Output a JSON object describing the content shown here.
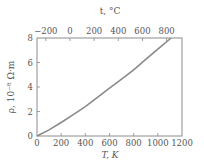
{
  "chart_data": {
    "type": "line",
    "title": "",
    "xlabel": "T, K",
    "ylabel": "ρ, 10⁻⁸ Ω·m",
    "x2label": "t, °C",
    "xlim": [
      0,
      1200
    ],
    "ylim": [
      0,
      8
    ],
    "x_ticks": [
      0,
      200,
      400,
      600,
      800,
      1000,
      1200
    ],
    "y_ticks": [
      0,
      2,
      4,
      6,
      8
    ],
    "x2_ticks": [
      -200,
      0,
      200,
      400,
      600,
      800
    ],
    "grid": false,
    "legend": null,
    "series": [
      {
        "name": "resistivity",
        "x": [
          0,
          100,
          200,
          300,
          400,
          500,
          600,
          700,
          800,
          900,
          1000,
          1110
        ],
        "values": [
          0,
          0.5,
          1.1,
          1.75,
          2.4,
          3.15,
          3.9,
          4.65,
          5.4,
          6.25,
          7.1,
          8.0
        ]
      }
    ],
    "colors": {
      "curve": "#8a8a8a",
      "frame": "#8c8c8c",
      "text": "#555555"
    }
  }
}
